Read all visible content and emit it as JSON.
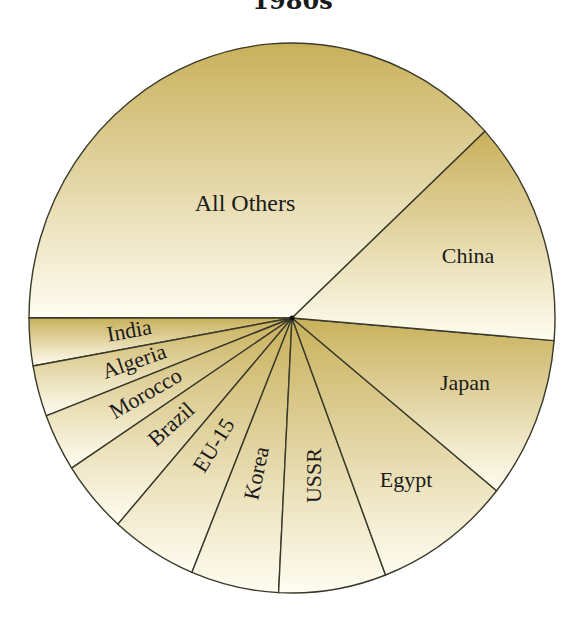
{
  "chart_data": {
    "type": "pie",
    "title": "1980s",
    "xlabel": "",
    "ylabel": "",
    "legend": "none (labels inside slices)",
    "start_angle_deg": 42.8,
    "direction": "counterclockwise",
    "categories": [
      "All Others",
      "India",
      "Algeria",
      "Morocco",
      "Brazil",
      "EU-15",
      "Korea",
      "USSR",
      "Egypt",
      "Japan",
      "China"
    ],
    "values": [
      38.1,
      2.8,
      3.0,
      3.4,
      4.3,
      5.3,
      5.4,
      6.6,
      8.4,
      9.5,
      13.2
    ],
    "unit": "% share (estimated from slice angles)"
  },
  "colors": {
    "slice_top": "#c8b05a",
    "slice_bottom": "#fffdf2",
    "outline": "#3a3a2a",
    "text": "#1a1a1a"
  }
}
